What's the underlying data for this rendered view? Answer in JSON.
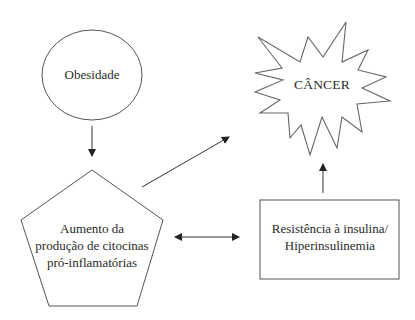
{
  "diagram": {
    "nodes": {
      "obesidade": {
        "label": "Obesidade",
        "shape": "ellipse"
      },
      "cancer": {
        "label": "CÂNCER",
        "shape": "starburst"
      },
      "citocinas": {
        "label_lines": [
          "Aumento da",
          "produção de citocinas",
          "pró-inflamatórias"
        ],
        "shape": "pentagon"
      },
      "insulina": {
        "label_lines": [
          "Resistência à insulina/",
          "Hiperinsulinemia"
        ],
        "shape": "rectangle"
      }
    },
    "edges": [
      {
        "from": "Obesidade",
        "to": "Aumento da produção de citocinas pró-inflamatórias",
        "type": "arrow"
      },
      {
        "from": "Aumento da produção de citocinas pró-inflamatórias",
        "to": "CÂNCER",
        "type": "arrow"
      },
      {
        "from": "Aumento da produção de citocinas pró-inflamatórias",
        "to": "Resistência à insulina/Hiperinsulinemia",
        "type": "double-arrow"
      },
      {
        "from": "Resistência à insulina/Hiperinsulinemia",
        "to": "CÂNCER",
        "type": "arrow"
      }
    ],
    "colors": {
      "stroke": "#444444",
      "text": "#2a2a2a",
      "background": "#ffffff"
    }
  }
}
